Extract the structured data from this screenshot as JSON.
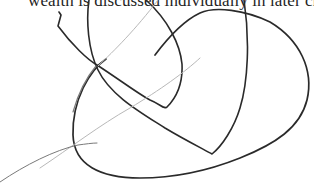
{
  "document": {
    "caption_text": "wealth is discussed individually in later chapters."
  },
  "annotation": {
    "stroke_colors": {
      "dark": "#2a2a2a",
      "mid": "#7a7a7a",
      "light": "#b8b8b8"
    },
    "strokes": [
      {
        "name": "dark-leaf-loop",
        "color": "dark",
        "width": 1.6,
        "d": "M59 12 L61 15 L58 26 C72 45 88 60 97 65 C120 80 140 95 150 100 C160 104 165 110 167 107 C176 98 183 84 182 64 C180 44 168 20 146 0"
      },
      {
        "name": "dark-tall-arc",
        "color": "dark",
        "width": 1.6,
        "d": "M89 0 C86 20 88 50 98 70 C110 95 140 112 165 128 C185 140 205 150 212 154 C222 146 234 128 240 108 C248 82 250 40 244 0"
      },
      {
        "name": "dark-large-oval",
        "color": "dark",
        "width": 1.7,
        "d": "M106 59 C90 70 72 100 73 135 C74 165 100 178 140 178 C180 178 215 168 240 158 C275 144 300 128 307 100 C314 70 300 40 270 22 C245 10 215 6 200 13 C185 20 170 35 155 55"
      },
      {
        "name": "mid-left-arc",
        "color": "mid",
        "width": 1.2,
        "d": "M96 66 C86 78 78 94 73 112"
      },
      {
        "name": "light-long-diagonal",
        "color": "light",
        "width": 1.0,
        "d": "M40 168 C70 148 100 125 130 108 C160 90 185 72 200 58"
      },
      {
        "name": "light-upper-diagonal",
        "color": "light",
        "width": 1.0,
        "d": "M98 66 C115 50 135 30 158 0"
      },
      {
        "name": "light-bottom-swoosh",
        "color": "mid",
        "width": 1.0,
        "d": "M0 182 C25 165 55 150 78 145 C86 144 92 143 97 143"
      }
    ]
  }
}
